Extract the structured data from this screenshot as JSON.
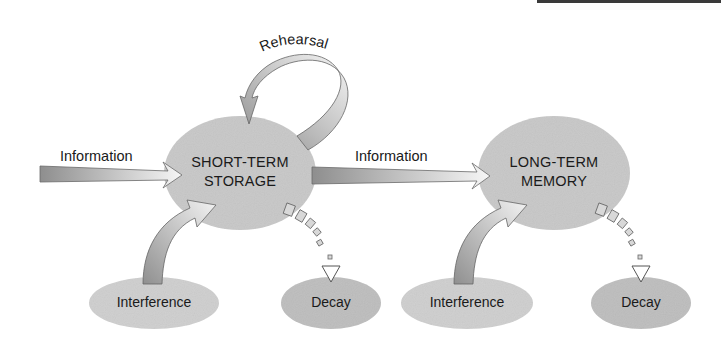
{
  "nodes": {
    "short_term": {
      "line1": "SHORT-TERM",
      "line2": "STORAGE"
    },
    "long_term": {
      "line1": "LONG-TERM",
      "line2": "MEMORY"
    },
    "interference_1": {
      "label": "Interference"
    },
    "decay_1": {
      "label": "Decay"
    },
    "interference_2": {
      "label": "Interference"
    },
    "decay_2": {
      "label": "Decay"
    }
  },
  "edges": {
    "information_in": {
      "label": "Information"
    },
    "information_transfer": {
      "label": "Information"
    },
    "rehearsal": {
      "label": "Rehearsal"
    }
  },
  "colors": {
    "node_fill": "#c8c8c8",
    "small_node_fill": "#cfcfcf",
    "decay_fill": "#bdbdbd",
    "arrow_dark": "#8a8a8a",
    "arrow_light": "#f4f4f4",
    "stroke": "#555555",
    "text": "#1a1a1a"
  }
}
